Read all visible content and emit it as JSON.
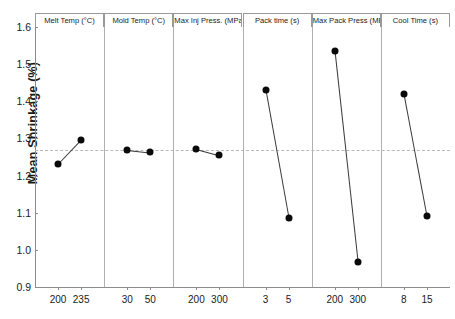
{
  "chart_data": {
    "type": "line",
    "title": "",
    "xlabel": "",
    "ylabel": "Mean Shrinkage (%)",
    "ylim": [
      0.9,
      1.6
    ],
    "yticks": [
      "0.9",
      "1.0",
      "1.1",
      "1.2",
      "1.3",
      "1.4",
      "1.5",
      "1.6"
    ],
    "grid": false,
    "legend": "none",
    "reference_line": 1.27,
    "panels": [
      {
        "name": "Melt Temp (°C)",
        "categories": [
          "200",
          "235"
        ],
        "values": [
          1.23,
          1.295
        ]
      },
      {
        "name": "Mold Temp (°C)",
        "categories": [
          "30",
          "50"
        ],
        "values": [
          1.27,
          1.263
        ]
      },
      {
        "name": "Max Inj Press. (MPa)",
        "categories": [
          "200",
          "300"
        ],
        "values": [
          1.272,
          1.255
        ]
      },
      {
        "name": "Pack time (s)",
        "categories": [
          "3",
          "5"
        ],
        "values": [
          1.43,
          1.085
        ]
      },
      {
        "name": "Max Pack Press (MPa)",
        "categories": [
          "200",
          "300"
        ],
        "values": [
          1.535,
          0.968
        ]
      },
      {
        "name": "Cool Time (s)",
        "categories": [
          "8",
          "15"
        ],
        "values": [
          1.42,
          1.09
        ]
      }
    ]
  },
  "colors": {
    "marker": "#0a0a0a",
    "line": "#3a3a3a",
    "axis": "#8c8c8c",
    "reference": "#b8b8b8",
    "background": "#ffffff"
  }
}
